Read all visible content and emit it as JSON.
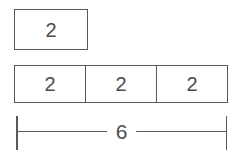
{
  "diagram": {
    "top_box": {
      "label": "2"
    },
    "row_cells": [
      {
        "label": "2"
      },
      {
        "label": "2"
      },
      {
        "label": "2"
      }
    ],
    "dimension": {
      "label": "6"
    },
    "colors": {
      "line": "#5a5a5a",
      "text": "#4d4d4d",
      "background": "#ffffff"
    }
  }
}
